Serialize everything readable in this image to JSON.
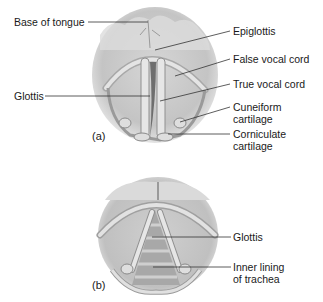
{
  "figure": {
    "panel_a": {
      "tag": "(a)",
      "labels": {
        "base_of_tongue": "Base of tongue",
        "epiglottis": "Epiglottis",
        "false_vocal_cord": "False vocal cord",
        "true_vocal_cord": "True vocal cord",
        "glottis": "Glottis",
        "cuneiform_1": "Cuneiform",
        "cuneiform_2": "cartilage",
        "corniculate_1": "Corniculate",
        "corniculate_2": "cartilage"
      }
    },
    "panel_b": {
      "tag": "(b)",
      "labels": {
        "glottis": "Glottis",
        "inner_lining_1": "Inner lining",
        "inner_lining_2": "of trachea"
      }
    },
    "colors": {
      "background": "#ffffff",
      "tissue_light": "#e8e8e8",
      "tissue_mid": "#c8c8c8",
      "tissue_dark": "#8a8a8a",
      "leader_line": "#333333",
      "text": "#1a1a1a"
    }
  }
}
